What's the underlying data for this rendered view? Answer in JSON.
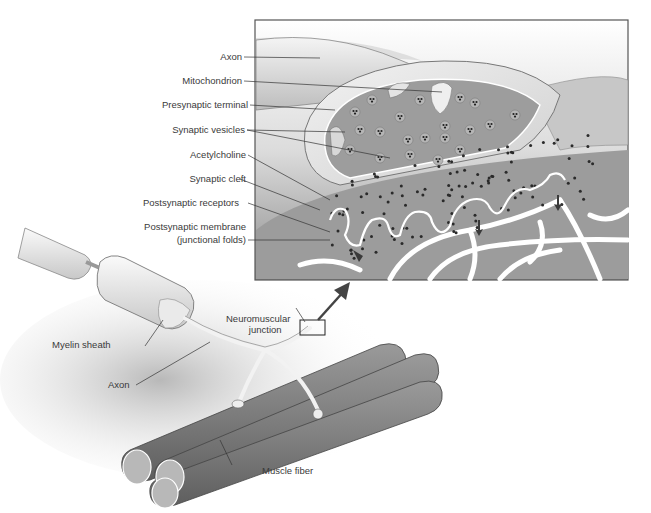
{
  "figure": {
    "inset_labels": [
      {
        "id": "axon",
        "text": "Axon"
      },
      {
        "id": "mitochondrion",
        "text": "Mitochondrion"
      },
      {
        "id": "presynaptic-terminal",
        "text": "Presynaptic terminal"
      },
      {
        "id": "synaptic-vesicles",
        "text": "Synaptic vesicles"
      },
      {
        "id": "acetylcholine",
        "text": "Acetylcholine"
      },
      {
        "id": "synaptic-cleft",
        "text": "Synaptic cleft"
      },
      {
        "id": "postsynaptic-receptors",
        "text": "Postsynaptic receptors"
      },
      {
        "id": "postsynaptic-membrane",
        "text": "Postsynaptic membrane"
      },
      {
        "id": "postsynaptic-membrane-sub",
        "text": "(junctional folds)"
      }
    ],
    "overview_labels": {
      "myelin_sheath": "Myelin sheath",
      "axon": "Axon",
      "nmj_line1": "Neuromuscular",
      "nmj_line2": "junction",
      "muscle_fiber": "Muscle fiber"
    },
    "colors": {
      "line": "#333333",
      "text": "#3a3a3a",
      "tissue_light": "#e8e8e8",
      "tissue_mid": "#a9a9a9",
      "tissue_dark": "#6e6e6e",
      "dots": "#2a2a2a"
    }
  }
}
